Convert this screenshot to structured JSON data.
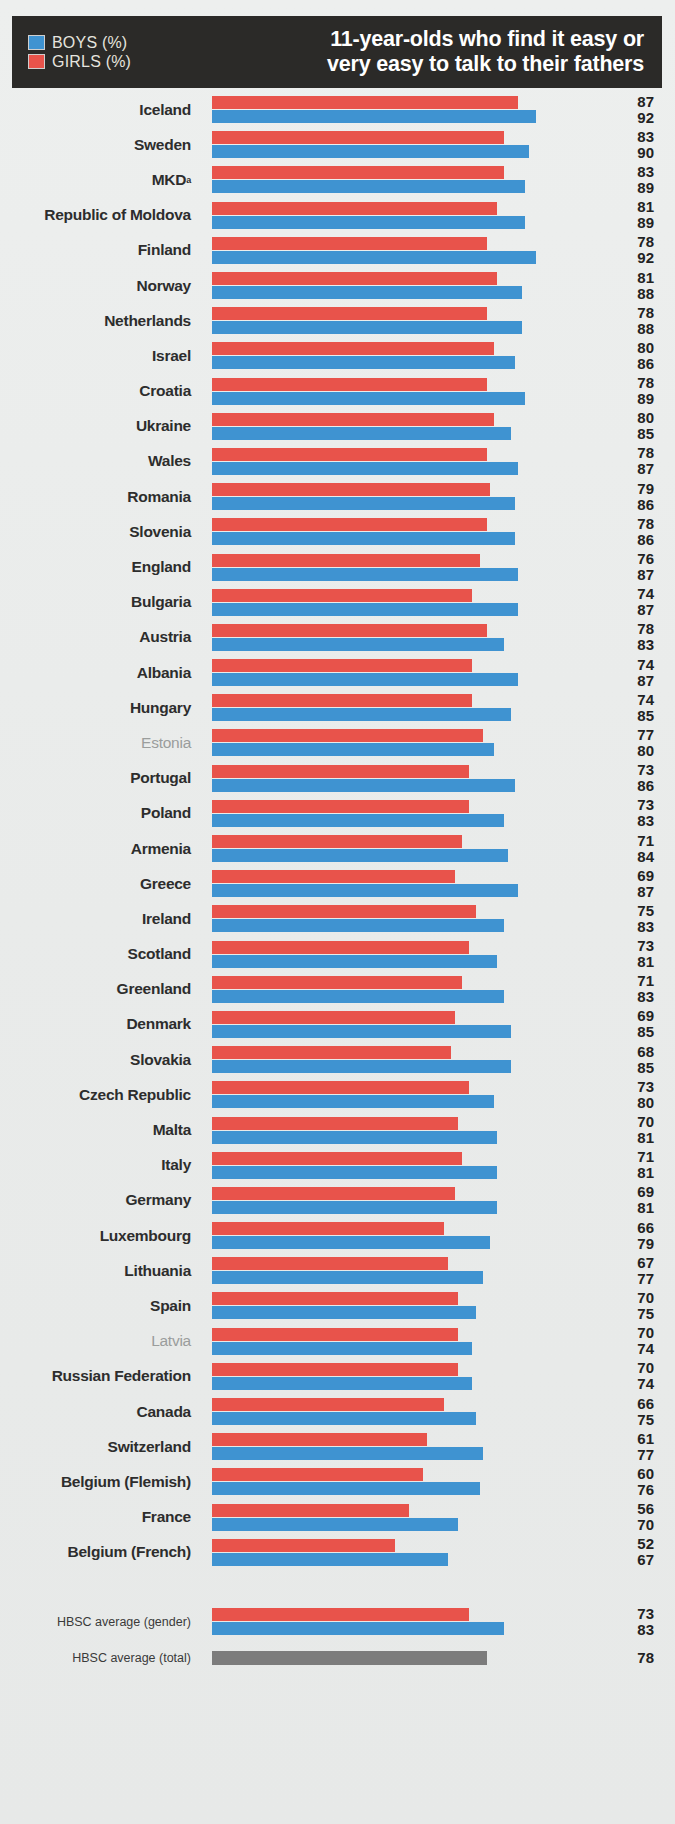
{
  "header": {
    "title_line1": "11-year-olds who find it easy or",
    "title_line2": "very easy to talk to their fathers",
    "legend": [
      {
        "label": "BOYS (%)",
        "color": "#3f93d1",
        "key": "boys"
      },
      {
        "label": "GIRLS (%)",
        "color": "#e8534b",
        "key": "girls"
      }
    ]
  },
  "chart_data": {
    "type": "bar",
    "orientation": "horizontal",
    "title": "11-year-olds who find it easy or very easy to talk to their fathers",
    "xlabel": "",
    "ylabel": "",
    "xlim": [
      0,
      100
    ],
    "grid": false,
    "legend_position": "top-left",
    "value_label_order": "girls над boys",
    "categories": [
      "Iceland",
      "Sweden",
      "MKD",
      "Republic of Moldova",
      "Finland",
      "Norway",
      "Netherlands",
      "Israel",
      "Croatia",
      "Ukraine",
      "Wales",
      "Romania",
      "Slovenia",
      "England",
      "Bulgaria",
      "Austria",
      "Albania",
      "Hungary",
      "Estonia",
      "Portugal",
      "Poland",
      "Armenia",
      "Greece",
      "Ireland",
      "Scotland",
      "Greenland",
      "Denmark",
      "Slovakia",
      "Czech Republic",
      "Malta",
      "Italy",
      "Germany",
      "Luxembourg",
      "Lithuania",
      "Spain",
      "Latvia",
      "Russian Federation",
      "Canada",
      "Switzerland",
      "Belgium (Flemish)",
      "France",
      "Belgium (French)"
    ],
    "series": [
      {
        "name": "GIRLS (%)",
        "color": "#e8534b",
        "values": [
          87,
          83,
          83,
          81,
          78,
          81,
          78,
          80,
          78,
          80,
          78,
          79,
          78,
          76,
          74,
          78,
          74,
          74,
          77,
          73,
          73,
          71,
          69,
          75,
          73,
          71,
          69,
          68,
          73,
          70,
          71,
          69,
          66,
          67,
          70,
          70,
          70,
          66,
          61,
          60,
          56,
          52
        ]
      },
      {
        "name": "BOYS (%)",
        "color": "#3f93d1",
        "values": [
          92,
          90,
          89,
          89,
          92,
          88,
          88,
          86,
          89,
          85,
          87,
          86,
          86,
          87,
          87,
          83,
          87,
          85,
          80,
          86,
          83,
          84,
          87,
          83,
          81,
          83,
          85,
          85,
          80,
          81,
          81,
          81,
          79,
          77,
          75,
          74,
          74,
          75,
          77,
          76,
          70,
          67
        ]
      }
    ],
    "averages": [
      {
        "label": "HBSC average (gender)",
        "girls": 73,
        "boys": 83
      },
      {
        "label": "HBSC average (total)",
        "total": 78,
        "color": "#7c7c7c"
      }
    ],
    "notes": [
      {
        "marker": "a",
        "applies_to": "MKD"
      }
    ]
  },
  "rows": [
    {
      "name": "Iceland",
      "girls": 87,
      "boys": 92,
      "dim": false
    },
    {
      "name": "Sweden",
      "girls": 83,
      "boys": 90,
      "dim": false
    },
    {
      "name": "MKD",
      "girls": 83,
      "boys": 89,
      "dim": false,
      "sup": "a"
    },
    {
      "name": "Republic of Moldova",
      "girls": 81,
      "boys": 89,
      "dim": false
    },
    {
      "name": "Finland",
      "girls": 78,
      "boys": 92,
      "dim": false
    },
    {
      "name": "Norway",
      "girls": 81,
      "boys": 88,
      "dim": false
    },
    {
      "name": "Netherlands",
      "girls": 78,
      "boys": 88,
      "dim": false
    },
    {
      "name": "Israel",
      "girls": 80,
      "boys": 86,
      "dim": false
    },
    {
      "name": "Croatia",
      "girls": 78,
      "boys": 89,
      "dim": false
    },
    {
      "name": "Ukraine",
      "girls": 80,
      "boys": 85,
      "dim": false
    },
    {
      "name": "Wales",
      "girls": 78,
      "boys": 87,
      "dim": false
    },
    {
      "name": "Romania",
      "girls": 79,
      "boys": 86,
      "dim": false
    },
    {
      "name": "Slovenia",
      "girls": 78,
      "boys": 86,
      "dim": false
    },
    {
      "name": "England",
      "girls": 76,
      "boys": 87,
      "dim": false
    },
    {
      "name": "Bulgaria",
      "girls": 74,
      "boys": 87,
      "dim": false
    },
    {
      "name": "Austria",
      "girls": 78,
      "boys": 83,
      "dim": false
    },
    {
      "name": "Albania",
      "girls": 74,
      "boys": 87,
      "dim": false
    },
    {
      "name": "Hungary",
      "girls": 74,
      "boys": 85,
      "dim": false
    },
    {
      "name": "Estonia",
      "girls": 77,
      "boys": 80,
      "dim": true
    },
    {
      "name": "Portugal",
      "girls": 73,
      "boys": 86,
      "dim": false
    },
    {
      "name": "Poland",
      "girls": 73,
      "boys": 83,
      "dim": false
    },
    {
      "name": "Armenia",
      "girls": 71,
      "boys": 84,
      "dim": false
    },
    {
      "name": "Greece",
      "girls": 69,
      "boys": 87,
      "dim": false
    },
    {
      "name": "Ireland",
      "girls": 75,
      "boys": 83,
      "dim": false
    },
    {
      "name": "Scotland",
      "girls": 73,
      "boys": 81,
      "dim": false
    },
    {
      "name": "Greenland",
      "girls": 71,
      "boys": 83,
      "dim": false
    },
    {
      "name": "Denmark",
      "girls": 69,
      "boys": 85,
      "dim": false
    },
    {
      "name": "Slovakia",
      "girls": 68,
      "boys": 85,
      "dim": false
    },
    {
      "name": "Czech Republic",
      "girls": 73,
      "boys": 80,
      "dim": false
    },
    {
      "name": "Malta",
      "girls": 70,
      "boys": 81,
      "dim": false
    },
    {
      "name": "Italy",
      "girls": 71,
      "boys": 81,
      "dim": false
    },
    {
      "name": "Germany",
      "girls": 69,
      "boys": 81,
      "dim": false
    },
    {
      "name": "Luxembourg",
      "girls": 66,
      "boys": 79,
      "dim": false
    },
    {
      "name": "Lithuania",
      "girls": 67,
      "boys": 77,
      "dim": false
    },
    {
      "name": "Spain",
      "girls": 70,
      "boys": 75,
      "dim": false
    },
    {
      "name": "Latvia",
      "girls": 70,
      "boys": 74,
      "dim": true
    },
    {
      "name": "Russian Federation",
      "girls": 70,
      "boys": 74,
      "dim": false
    },
    {
      "name": "Canada",
      "girls": 66,
      "boys": 75,
      "dim": false
    },
    {
      "name": "Switzerland",
      "girls": 61,
      "boys": 77,
      "dim": false
    },
    {
      "name": "Belgium (Flemish)",
      "girls": 60,
      "boys": 76,
      "dim": false
    },
    {
      "name": "France",
      "girls": 56,
      "boys": 70,
      "dim": false
    },
    {
      "name": "Belgium (French)",
      "girls": 52,
      "boys": 67,
      "dim": false
    }
  ],
  "average_rows": [
    {
      "name": "HBSC average (gender)",
      "girls": 73,
      "boys": 83
    },
    {
      "name": "HBSC average (total)",
      "total": 78
    }
  ],
  "colors": {
    "boys": "#3f93d1",
    "girls": "#e8534b",
    "total": "#7c7c7c",
    "header_bg": "#2b2a28",
    "page_bg": "#eef0ef"
  }
}
